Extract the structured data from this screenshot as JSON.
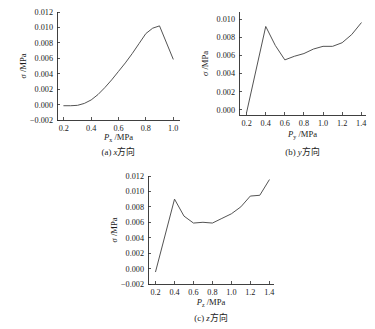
{
  "figure": {
    "background_color": "#ffffff",
    "curve_color": "#4a4a4a",
    "axis_color": "#2b2b2b"
  },
  "chart_data": [
    {
      "id": "a",
      "type": "line",
      "title": "",
      "caption": "(a)  x方向",
      "caption_prefix": "(a)",
      "caption_direction": "x",
      "caption_suffix": "方向",
      "xlabel": "P",
      "xlabel_sub": "x",
      "xlabel_unit": "/MPa",
      "ylabel": "σ",
      "ylabel_unit": "/MPa",
      "xlim": [
        0.15,
        1.05
      ],
      "ylim": [
        -0.002,
        0.012
      ],
      "xticks": [
        0.2,
        0.4,
        0.6,
        0.8,
        1.0
      ],
      "xticklabels": [
        "0.2",
        "0.4",
        "0.6",
        "0.8",
        "1.0"
      ],
      "yticks": [
        -0.002,
        0.0,
        0.002,
        0.004,
        0.006,
        0.008,
        0.01,
        0.012
      ],
      "yticklabels": [
        "-0.002",
        "0.000",
        "0.002",
        "0.004",
        "0.006",
        "0.008",
        "0.010",
        "0.012"
      ],
      "grid": false,
      "legend": false,
      "x": [
        0.2,
        0.25,
        0.3,
        0.35,
        0.4,
        0.45,
        0.5,
        0.55,
        0.6,
        0.65,
        0.7,
        0.75,
        0.8,
        0.85,
        0.9,
        1.0
      ],
      "values": [
        -0.00015,
        -0.00015,
        -0.0001,
        0.00015,
        0.0006,
        0.0013,
        0.0022,
        0.0032,
        0.0043,
        0.0054,
        0.0066,
        0.0079,
        0.0092,
        0.0099,
        0.0102,
        0.0059
      ]
    },
    {
      "id": "b",
      "type": "line",
      "title": "",
      "caption": "(b)  y方向",
      "caption_prefix": "(b)",
      "caption_direction": "y",
      "caption_suffix": "方向",
      "xlabel": "P",
      "xlabel_sub": "y",
      "xlabel_unit": "/MPa",
      "ylabel": "σ",
      "ylabel_unit": "/MPa",
      "xlim": [
        0.12,
        1.45
      ],
      "ylim": [
        -0.0006,
        0.0108
      ],
      "xticks": [
        0.2,
        0.4,
        0.6,
        0.8,
        1.0,
        1.2,
        1.4
      ],
      "xticklabels": [
        "0.2",
        "0.4",
        "0.6",
        "0.8",
        "1.0",
        "1.2",
        "1.4"
      ],
      "yticks": [
        0.0,
        0.002,
        0.004,
        0.006,
        0.008,
        0.01
      ],
      "yticklabels": [
        "0.000",
        "0.002",
        "0.004",
        "0.006",
        "0.008",
        "0.010"
      ],
      "grid": false,
      "legend": false,
      "x": [
        0.2,
        0.4,
        0.5,
        0.6,
        0.7,
        0.8,
        0.9,
        1.0,
        1.1,
        1.2,
        1.3,
        1.4
      ],
      "values": [
        -0.0003,
        0.0092,
        0.0071,
        0.0055,
        0.0059,
        0.0062,
        0.0067,
        0.007,
        0.007,
        0.0074,
        0.0083,
        0.0096
      ]
    },
    {
      "id": "c",
      "type": "line",
      "title": "",
      "caption": "(c)  z方向",
      "caption_prefix": "(c)",
      "caption_direction": "z",
      "caption_suffix": "方向",
      "xlabel": "P",
      "xlabel_sub": "z",
      "xlabel_unit": "/MPa",
      "ylabel": "σ",
      "ylabel_unit": "/MPa",
      "xlim": [
        0.12,
        1.45
      ],
      "ylim": [
        -0.002,
        0.012
      ],
      "xticks": [
        0.2,
        0.4,
        0.6,
        0.8,
        1.0,
        1.2,
        1.4
      ],
      "xticklabels": [
        "0.2",
        "0.4",
        "0.6",
        "0.8",
        "1.0",
        "1.2",
        "1.4"
      ],
      "yticks": [
        -0.002,
        0.0,
        0.002,
        0.004,
        0.006,
        0.008,
        0.01,
        0.012
      ],
      "yticklabels": [
        "-0.002",
        "0.000",
        "0.002",
        "0.004",
        "0.006",
        "0.008",
        "0.010",
        "0.012"
      ],
      "grid": false,
      "legend": false,
      "x": [
        0.2,
        0.4,
        0.5,
        0.6,
        0.7,
        0.8,
        0.9,
        1.0,
        1.1,
        1.2,
        1.3,
        1.4
      ],
      "values": [
        -0.0004,
        0.009,
        0.0068,
        0.0059,
        0.006,
        0.0059,
        0.0065,
        0.0071,
        0.008,
        0.0094,
        0.0095,
        0.0115
      ]
    }
  ]
}
